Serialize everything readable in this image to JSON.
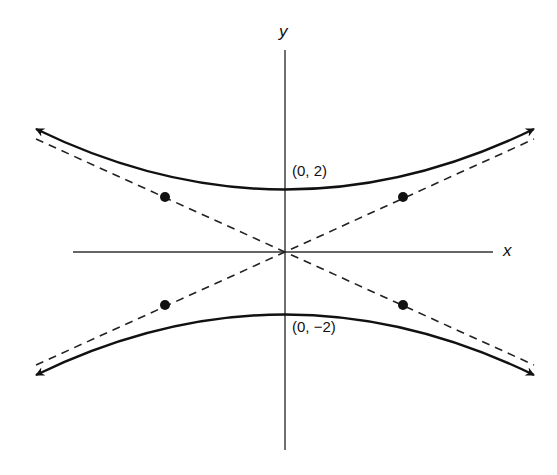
{
  "diagram": {
    "type": "hyperbola",
    "axes": {
      "x_label": "x",
      "y_label": "y"
    },
    "vertices": [
      {
        "label": "(0, 2)",
        "x": 0,
        "y": 2
      },
      {
        "label": "(0, −2)",
        "x": 0,
        "y": -2
      }
    ],
    "asymptotes": {
      "style": "dashed",
      "count": 2
    },
    "marked_points": 4,
    "colors": {
      "stroke": "#111111",
      "background": "#ffffff"
    }
  }
}
